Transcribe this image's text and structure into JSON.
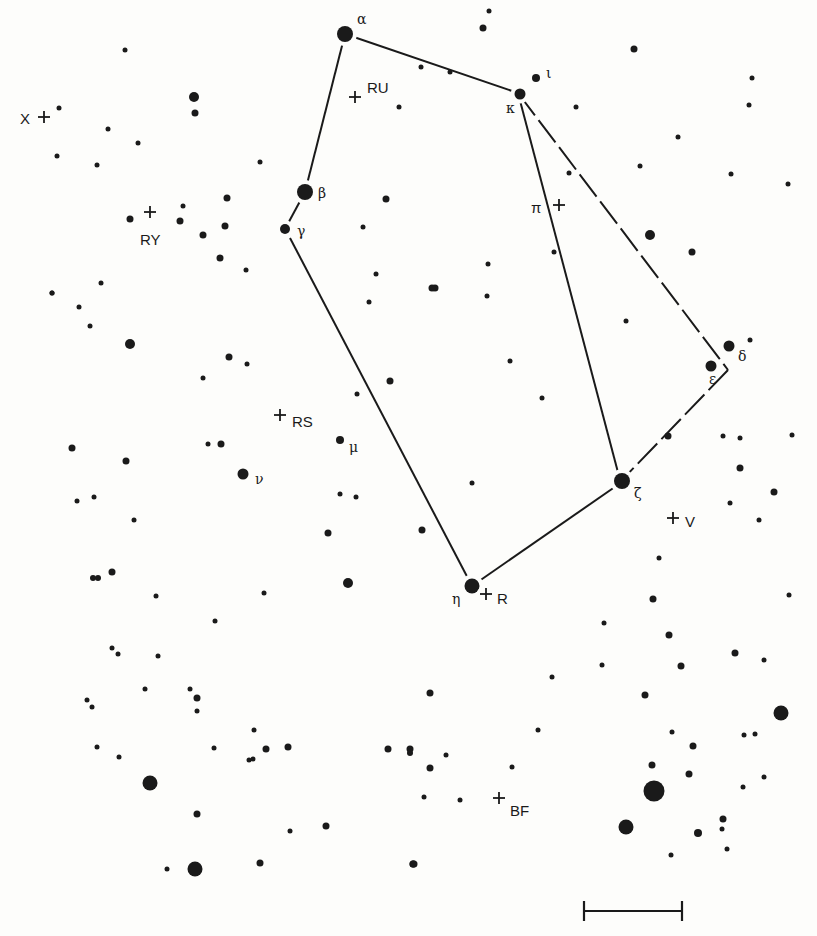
{
  "chart": {
    "ink_color": "#1a1a1a",
    "background": "#fdfdfb",
    "lines": [
      {
        "from": [
          345,
          34
        ],
        "to": [
          518,
          93
        ],
        "style": "solid"
      },
      {
        "from": [
          345,
          34
        ],
        "to": [
          305,
          192
        ],
        "style": "solid"
      },
      {
        "from": [
          305,
          192
        ],
        "to": [
          285,
          229
        ],
        "style": "solid"
      },
      {
        "from": [
          290,
          238
        ],
        "to": [
          472,
          586
        ],
        "style": "solid"
      },
      {
        "from": [
          472,
          586
        ],
        "to": [
          622,
          482
        ],
        "style": "solid"
      },
      {
        "from": [
          518,
          93
        ],
        "to": [
          620,
          480
        ],
        "style": "solid"
      },
      {
        "from": [
          518,
          93
        ],
        "to": [
          728,
          370
        ],
        "style": "dashed"
      },
      {
        "from": [
          728,
          370
        ],
        "to": [
          622,
          480
        ],
        "style": "dashed"
      }
    ],
    "named_stars": [
      {
        "greek": "α",
        "x": 345,
        "y": 34,
        "r": 8,
        "lx": 357,
        "ly": 24
      },
      {
        "greek": "β",
        "x": 305,
        "y": 192,
        "r": 8,
        "lx": 318,
        "ly": 198
      },
      {
        "greek": "γ",
        "x": 285,
        "y": 229,
        "r": 5,
        "lx": 297,
        "ly": 236
      },
      {
        "greek": "δ",
        "x": 729,
        "y": 346,
        "r": 5.5,
        "lx": 738,
        "ly": 361
      },
      {
        "greek": "ε",
        "x": 711,
        "y": 366,
        "r": 5.5,
        "lx": 709,
        "ly": 384
      },
      {
        "greek": "ζ",
        "x": 622,
        "y": 481,
        "r": 8,
        "lx": 634,
        "ly": 498
      },
      {
        "greek": "η",
        "x": 472,
        "y": 586,
        "r": 7.5,
        "lx": 452,
        "ly": 604
      },
      {
        "greek": "ι",
        "x": 536,
        "y": 78,
        "r": 4,
        "lx": 546,
        "ly": 78
      },
      {
        "greek": "κ",
        "x": 520,
        "y": 94,
        "r": 5.5,
        "lx": 506,
        "ly": 113
      },
      {
        "greek": "μ",
        "x": 340,
        "y": 440,
        "r": 4,
        "lx": 349,
        "ly": 452
      },
      {
        "greek": "ν",
        "x": 243,
        "y": 474,
        "r": 5.5,
        "lx": 255,
        "ly": 484
      }
    ],
    "variables": [
      {
        "label": "X",
        "cx": 44,
        "cy": 117,
        "lx": 20,
        "ly": 124,
        "anchor": "start"
      },
      {
        "label": "RU",
        "cx": 355,
        "cy": 97,
        "lx": 367,
        "ly": 93,
        "anchor": "start"
      },
      {
        "label": "RY",
        "cx": 150,
        "cy": 212,
        "lx": 140,
        "ly": 245,
        "anchor": "start"
      },
      {
        "label": "π",
        "cx": 559,
        "cy": 205,
        "lx": 531,
        "ly": 213,
        "anchor": "start"
      },
      {
        "label": "RS",
        "cx": 280,
        "cy": 415,
        "lx": 292,
        "ly": 427,
        "anchor": "start"
      },
      {
        "label": "V",
        "cx": 673,
        "cy": 518,
        "lx": 685,
        "ly": 527,
        "anchor": "start"
      },
      {
        "label": "R",
        "cx": 486,
        "cy": 594,
        "lx": 497,
        "ly": 604,
        "anchor": "start"
      },
      {
        "label": "BF",
        "cx": 499,
        "cy": 798,
        "lx": 510,
        "ly": 816,
        "anchor": "start"
      }
    ],
    "stars": [
      [
        125,
        50,
        2.5
      ],
      [
        194,
        97,
        5
      ],
      [
        195,
        113,
        3.5
      ],
      [
        59,
        108,
        2.5
      ],
      [
        108,
        129,
        2.5
      ],
      [
        138,
        143,
        2.5
      ],
      [
        57,
        156,
        2.5
      ],
      [
        97,
        165,
        2.5
      ],
      [
        260,
        162,
        2.5
      ],
      [
        399,
        107,
        2.5
      ],
      [
        130,
        219,
        3.5
      ],
      [
        183,
        206,
        2.5
      ],
      [
        180,
        221,
        3.5
      ],
      [
        227,
        198,
        3.5
      ],
      [
        225,
        226,
        3.5
      ],
      [
        203,
        235,
        3.5
      ],
      [
        220,
        258,
        3.5
      ],
      [
        246,
        270,
        2.5
      ],
      [
        101,
        283,
        2.5
      ],
      [
        52,
        293,
        2.5
      ],
      [
        386,
        199,
        3.5
      ],
      [
        363,
        227,
        2.5
      ],
      [
        376,
        274,
        2.5
      ],
      [
        369,
        302,
        2.5
      ],
      [
        435,
        288,
        3.5
      ],
      [
        489,
        11,
        2.5
      ],
      [
        483,
        28,
        3.5
      ],
      [
        421,
        67,
        2.5
      ],
      [
        450,
        72,
        2.5
      ],
      [
        634,
        49,
        3.5
      ],
      [
        752,
        78,
        2.5
      ],
      [
        749,
        105,
        2.5
      ],
      [
        576,
        107,
        2.5
      ],
      [
        678,
        137,
        2.5
      ],
      [
        640,
        166,
        2.5
      ],
      [
        569,
        173,
        2.5
      ],
      [
        731,
        174,
        2.5
      ],
      [
        788,
        184,
        2.5
      ],
      [
        650,
        235,
        5
      ],
      [
        692,
        252,
        3.5
      ],
      [
        554,
        252,
        2.5
      ],
      [
        488,
        264,
        2.5
      ],
      [
        432,
        288,
        3.5
      ],
      [
        487,
        296,
        2.5
      ],
      [
        52,
        293,
        2.5
      ],
      [
        79,
        307,
        2.5
      ],
      [
        90,
        326,
        2.5
      ],
      [
        130,
        344,
        5
      ],
      [
        229,
        357,
        3.5
      ],
      [
        247,
        364,
        2.5
      ],
      [
        203,
        378,
        2.5
      ],
      [
        390,
        381,
        3.5
      ],
      [
        357,
        394,
        2.5
      ],
      [
        626,
        321,
        2.5
      ],
      [
        510,
        361,
        2.5
      ],
      [
        542,
        398,
        2.5
      ],
      [
        750,
        340,
        2.5
      ],
      [
        668,
        436,
        3.5
      ],
      [
        723,
        436,
        2.5
      ],
      [
        740,
        438,
        2.5
      ],
      [
        792,
        435,
        2.5
      ],
      [
        740,
        468,
        3.5
      ],
      [
        774,
        492,
        3.5
      ],
      [
        730,
        503,
        2.5
      ],
      [
        759,
        520,
        2.5
      ],
      [
        472,
        483,
        2.5
      ],
      [
        422,
        530,
        3.5
      ],
      [
        659,
        558,
        2.5
      ],
      [
        653,
        599,
        3.5
      ],
      [
        789,
        595,
        2.5
      ],
      [
        72,
        448,
        3.5
      ],
      [
        126,
        461,
        3.5
      ],
      [
        208,
        444,
        2.5
      ],
      [
        221,
        444,
        3.5
      ],
      [
        77,
        501,
        2.5
      ],
      [
        94,
        497,
        2.5
      ],
      [
        134,
        520,
        2.5
      ],
      [
        340,
        494,
        2.5
      ],
      [
        356,
        497,
        2.5
      ],
      [
        328,
        533,
        3.5
      ],
      [
        93,
        578,
        3
      ],
      [
        98,
        578,
        3
      ],
      [
        112,
        572,
        3.5
      ],
      [
        156,
        596,
        2.5
      ],
      [
        264,
        593,
        2.5
      ],
      [
        348,
        583,
        5
      ],
      [
        215,
        621,
        2.5
      ],
      [
        112,
        648,
        2.5
      ],
      [
        118,
        654,
        2.5
      ],
      [
        158,
        656,
        2.5
      ],
      [
        145,
        689,
        2.5
      ],
      [
        190,
        689,
        2.5
      ],
      [
        197,
        698,
        3.5
      ],
      [
        197,
        711,
        2.5
      ],
      [
        87,
        700,
        2.5
      ],
      [
        92,
        707,
        2.5
      ],
      [
        97,
        747,
        2.5
      ],
      [
        119,
        757,
        2.5
      ],
      [
        214,
        748,
        2.5
      ],
      [
        254,
        730,
        2.5
      ],
      [
        266,
        749,
        3.5
      ],
      [
        249,
        760,
        2.5
      ],
      [
        253,
        759,
        2.5
      ],
      [
        150,
        783,
        7.5
      ],
      [
        197,
        814,
        3.5
      ],
      [
        290,
        831,
        2.5
      ],
      [
        326,
        826,
        3.5
      ],
      [
        288,
        747,
        3.5
      ],
      [
        388,
        749,
        3.5
      ],
      [
        410,
        749,
        3.5
      ],
      [
        260,
        863,
        3.5
      ],
      [
        167,
        869,
        2.5
      ],
      [
        195,
        869,
        7.5
      ],
      [
        413,
        864,
        3.5
      ],
      [
        604,
        623,
        2.5
      ],
      [
        669,
        635,
        3.5
      ],
      [
        735,
        653,
        3.5
      ],
      [
        764,
        660,
        2.5
      ],
      [
        681,
        666,
        3.5
      ],
      [
        552,
        677,
        2.5
      ],
      [
        602,
        665,
        2.5
      ],
      [
        645,
        695,
        3.5
      ],
      [
        430,
        693,
        3.5
      ],
      [
        781,
        713,
        7.5
      ],
      [
        538,
        730,
        2.5
      ],
      [
        672,
        732,
        2.5
      ],
      [
        744,
        735,
        2.5
      ],
      [
        755,
        734,
        2.5
      ],
      [
        693,
        746,
        3.5
      ],
      [
        410,
        753,
        3
      ],
      [
        446,
        755,
        2.5
      ],
      [
        430,
        768,
        3.5
      ],
      [
        652,
        765,
        3.5
      ],
      [
        689,
        774,
        3.5
      ],
      [
        512,
        767,
        2.5
      ],
      [
        743,
        787,
        2.5
      ],
      [
        764,
        777,
        2.5
      ],
      [
        460,
        800,
        2.5
      ],
      [
        424,
        797,
        2.5
      ],
      [
        654,
        791,
        10.5
      ],
      [
        626,
        827,
        7.5
      ],
      [
        723,
        819,
        3.5
      ],
      [
        698,
        833,
        4
      ],
      [
        722,
        829,
        2.5
      ],
      [
        727,
        849,
        2.5
      ],
      [
        671,
        855,
        2.5
      ],
      [
        413,
        864,
        3.5
      ],
      [
        414,
        864,
        3.5
      ]
    ],
    "scale_bar": {
      "x1": 584,
      "x2": 682,
      "y": 911,
      "tick_half_height": 10
    }
  }
}
